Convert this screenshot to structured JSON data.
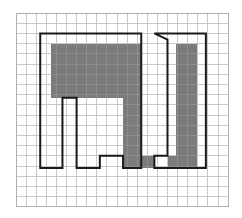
{
  "figure": {
    "canvas": {
      "width": 242,
      "height": 218,
      "background": "#ffffff"
    },
    "grid": {
      "name": "graph-paper-grid",
      "origin_x": 16,
      "origin_y": 13,
      "cell_size_x": 10.1,
      "cell_size_y": 10.2,
      "columns": 21,
      "rows": 19,
      "line_color": "#bfbfbf",
      "line_width": 0.8,
      "border_color": "#b0b0b0"
    },
    "shapes": [
      {
        "name": "shaded-region-left-block",
        "type": "filled-rect",
        "fill": "#7b7b7b",
        "grid_rect": {
          "x": 3.5,
          "y": 3.0,
          "w": 7.1,
          "h": 5.3
        }
      },
      {
        "name": "shaded-region-middle-strip",
        "type": "filled-rect",
        "fill": "#7b7b7b",
        "grid_rect": {
          "x": 10.6,
          "y": 3.0,
          "w": 1.8,
          "h": 12.2
        }
      },
      {
        "name": "shaded-region-bottom-bar",
        "type": "filled-rect",
        "fill": "#7b7b7b",
        "grid_rect": {
          "x": 12.4,
          "y": 14.0,
          "w": 1.3,
          "h": 1.2
        }
      },
      {
        "name": "shaded-region-bottom-bar-right",
        "type": "filled-rect",
        "fill": "#7b7b7b",
        "grid_rect": {
          "x": 15.0,
          "y": 14.0,
          "w": 0.8,
          "h": 1.2
        }
      },
      {
        "name": "shaded-region-right-block",
        "type": "filled-rect",
        "fill": "#7b7b7b",
        "grid_rect": {
          "x": 15.8,
          "y": 3.0,
          "w": 2.1,
          "h": 12.2
        }
      },
      {
        "name": "outline-polygon-left",
        "type": "stroked-polygon",
        "stroke": "#1a1a1a",
        "stroke_width": 2.0,
        "grid_points": "2.4,2.0 12.4,2.0 12.4,15.2 10.6,15.2 10.6,14.0 8.3,14.0 8.3,15.2 6.0,15.2 6.0,8.3 4.6,8.3 4.6,15.2 2.4,15.2"
      },
      {
        "name": "outline-polygon-right",
        "type": "stroked-polygon",
        "stroke": "#1a1a1a",
        "stroke_width": 2.0,
        "grid_points": "13.7,2.0 18.8,2.0 18.8,15.2 13.7,15.2 13.7,14.0 15.0,14.0 15.0,2.6"
      }
    ],
    "colors": {
      "fill_gray": "#7b7b7b",
      "outline_black": "#1a1a1a",
      "grid_line": "#bfbfbf",
      "background": "#ffffff"
    }
  }
}
